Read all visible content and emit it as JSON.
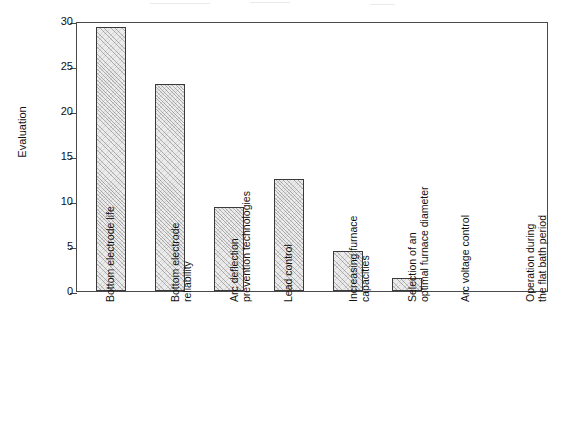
{
  "chart_data": {
    "type": "bar",
    "title": "",
    "xlabel": "",
    "ylabel": "Evaluation",
    "ylim": [
      0,
      30
    ],
    "ytick_values": [
      0,
      5,
      10,
      15,
      20,
      25,
      30
    ],
    "ytick_labels": [
      "0",
      "5",
      "10",
      "15",
      "20",
      "25",
      "30"
    ],
    "grid": false,
    "legend": "none",
    "categories": [
      "Bottom electrode life",
      "Bottom electrode reliability",
      "Arc deflection prevention technologies",
      "Lead control",
      "Increasing furnace capacities",
      "Selection of an optimal furnace diameter",
      "Arc voltage control",
      "Operation during the flat bath period"
    ],
    "category_lines": [
      [
        "Bottom electrode life"
      ],
      [
        "Bottom electrode",
        "reliability"
      ],
      [
        "Arc deflection",
        "prevention technologies"
      ],
      [
        "Lead control"
      ],
      [
        "Increasing furnace",
        "capacities"
      ],
      [
        "Selection of an",
        "optimal furnace diameter"
      ],
      [
        "Arc voltage control"
      ],
      [
        "Operation during",
        "the flat bath period"
      ]
    ],
    "values": [
      29.3,
      23.0,
      9.3,
      12.4,
      4.4,
      1.5,
      0,
      0
    ],
    "bar_fill": "#ebebeb",
    "bar_edge": "#3a3a3a",
    "axis_color": "#4a4a4a",
    "background": "#ffffff"
  }
}
